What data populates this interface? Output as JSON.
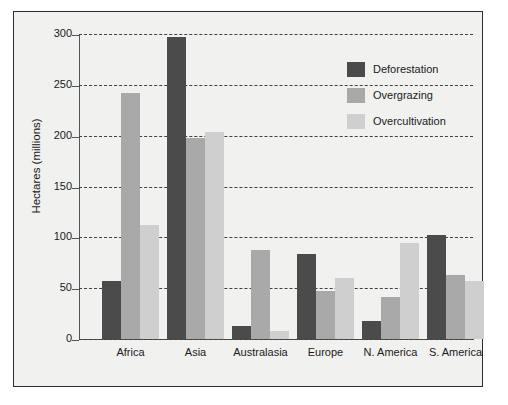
{
  "chart_data": {
    "type": "bar",
    "title": "",
    "xlabel": "",
    "ylabel": "Hectares (millions)",
    "ylim": [
      0,
      300
    ],
    "yticks": [
      0,
      50,
      100,
      150,
      200,
      250,
      300
    ],
    "ytick_labels": [
      "0",
      "50",
      "100",
      "150",
      "200",
      "250",
      "300"
    ],
    "grid": true,
    "grid_style": "dashed-horizontal",
    "legend_position": "top-right-inside",
    "categories": [
      "Africa",
      "Asia",
      "Australasia",
      "Europe",
      "N. America",
      "S. America"
    ],
    "series": [
      {
        "name": "Deforestation",
        "color": "#4b4b4b",
        "values": [
          57,
          297,
          13,
          84,
          18,
          102
        ]
      },
      {
        "name": "Overgrazing",
        "color": "#a9a9a9",
        "values": [
          242,
          198,
          88,
          47,
          41,
          63
        ]
      },
      {
        "name": "Overcultivation",
        "color": "#cfcfcf",
        "values": [
          112,
          204,
          8,
          60,
          94,
          57
        ]
      }
    ]
  },
  "figure": {
    "background_color": "#f1f1f0",
    "border_color": "#2b2b2b",
    "page_background": "#ffffff"
  }
}
